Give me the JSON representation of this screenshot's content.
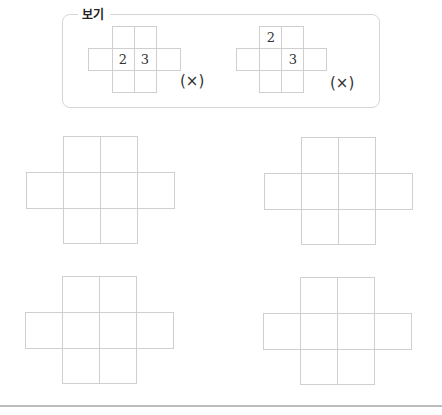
{
  "example_box": {
    "title": "보기",
    "examples": [
      {
        "numbers": [
          "2",
          "3"
        ],
        "mark": "(×)"
      },
      {
        "numbers": [
          "2",
          "3"
        ],
        "mark": "(×)"
      }
    ]
  },
  "exercise_grids": [
    {
      "label": "grid-1"
    },
    {
      "label": "grid-2"
    },
    {
      "label": "grid-3"
    },
    {
      "label": "grid-4"
    }
  ]
}
